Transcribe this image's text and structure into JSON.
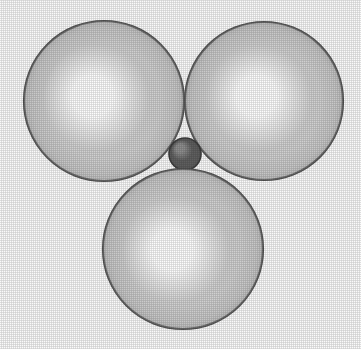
{
  "figure": {
    "title": "Space-filling sphere packing diagram",
    "description": "Three large light gray spheres arranged in a triangle around one small dark gray sphere at the central interstitial site",
    "width": 361,
    "height": 349,
    "background_color": "#fcfcfc",
    "render_style": "halftone shaded spheres, scanned print appearance"
  },
  "palette": {
    "background": "#fcfcfc",
    "large_sphere_highlight": "#ffffff",
    "large_sphere_mid": "#d2d2d2",
    "large_sphere_edge": "#9a9a9a",
    "large_sphere_outline": "#555555",
    "small_sphere_highlight": "#8f8f8f",
    "small_sphere_mid": "#606060",
    "small_sphere_edge": "#484848",
    "small_sphere_outline": "#3c3c3c"
  },
  "spheres": [
    {
      "id": "large-sphere-top-left",
      "label": "Large sphere, upper left",
      "role": "large anion",
      "cx": 104,
      "cy": 101,
      "r": 80,
      "highlight_x": 90,
      "highlight_y": 95,
      "fill_light": "#ffffff",
      "fill_mid": "#d2d2d2",
      "fill_dark": "#9a9a9a",
      "outline": "#555555",
      "z": 1
    },
    {
      "id": "large-sphere-top-right",
      "label": "Large sphere, upper right",
      "role": "large anion",
      "cx": 264,
      "cy": 101,
      "r": 79,
      "highlight_x": 255,
      "highlight_y": 95,
      "fill_light": "#ffffff",
      "fill_mid": "#d2d2d2",
      "fill_dark": "#9a9a9a",
      "outline": "#555555",
      "z": 2
    },
    {
      "id": "small-sphere-center",
      "label": "Small sphere, central interstitial site",
      "role": "small cation",
      "cx": 185,
      "cy": 154,
      "r": 16,
      "highlight_x": 179,
      "highlight_y": 147,
      "fill_light": "#8f8f8f",
      "fill_mid": "#606060",
      "fill_dark": "#484848",
      "outline": "#3c3c3c",
      "z": 3
    },
    {
      "id": "large-sphere-bottom",
      "label": "Large sphere, lower center",
      "role": "large anion",
      "cx": 183,
      "cy": 249,
      "r": 80,
      "highlight_x": 170,
      "highlight_y": 250,
      "fill_light": "#ffffff",
      "fill_mid": "#d2d2d2",
      "fill_dark": "#9a9a9a",
      "outline": "#555555",
      "z": 4
    }
  ],
  "annotations": {
    "caption": "",
    "labels": []
  }
}
